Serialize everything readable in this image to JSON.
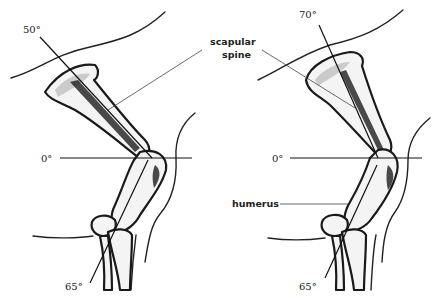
{
  "figure": {
    "left_panel": {
      "scapula_angle": "50°",
      "horizontal_angle": "0°",
      "lower_angle": "65°"
    },
    "right_panel": {
      "scapula_angle": "70°",
      "horizontal_angle": "0°",
      "lower_angle": "65°"
    },
    "labels": {
      "scapular_spine_line1": "scapular",
      "scapular_spine_line2": "spine",
      "humerus": "humerus"
    }
  }
}
